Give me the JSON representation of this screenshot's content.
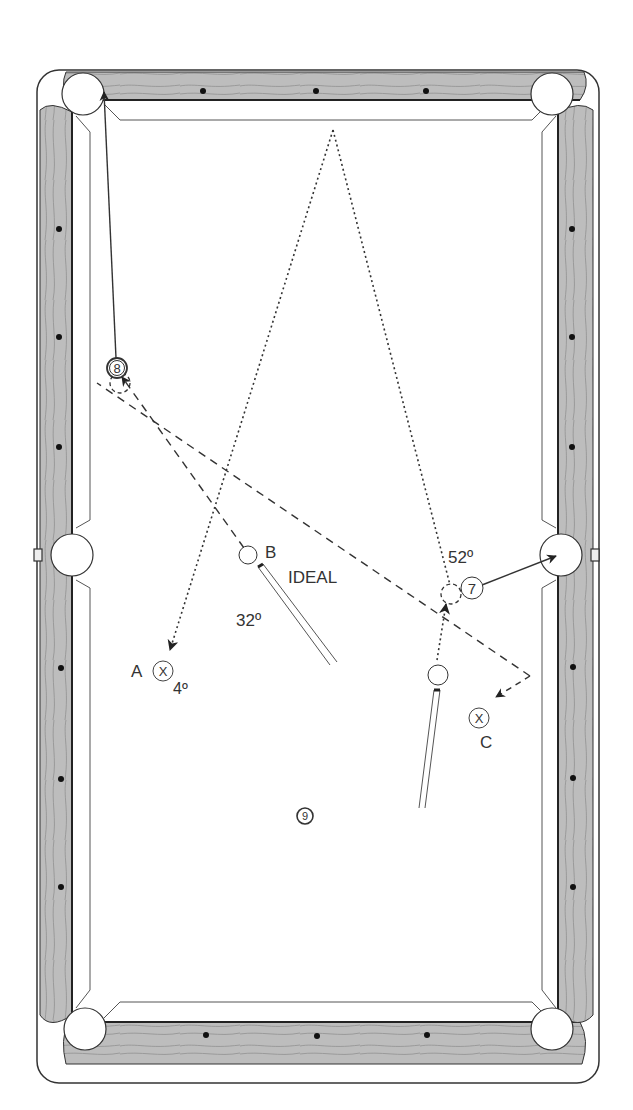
{
  "diagram": {
    "colors": {
      "rail_wood": "#b9b9b9",
      "rail_outline": "#333333",
      "cloth": "#ffffff",
      "line": "#333333",
      "diamond": "#111111"
    },
    "labels": {
      "position_a": "A",
      "position_b": "B",
      "position_c": "C",
      "ideal": "IDEAL",
      "angle_a": "4º",
      "angle_b": "32º",
      "angle_7": "52º"
    },
    "balls": {
      "eight": "8",
      "seven": "7",
      "nine": "9",
      "x_mark": "X"
    },
    "rail_diamonds": {
      "top": 3,
      "bottom": 3,
      "left": 6,
      "right": 6
    },
    "pockets": [
      "top-left-corner",
      "top-right-corner",
      "left-side",
      "right-side",
      "bottom-left-corner",
      "bottom-right-corner"
    ]
  }
}
